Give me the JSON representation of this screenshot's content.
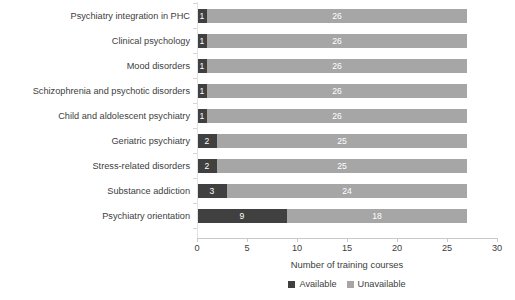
{
  "chart_data": {
    "type": "bar",
    "title": "",
    "subtitle": "",
    "orientation": "horizontal",
    "stacked": true,
    "xlabel": "Number of training courses",
    "ylabel": "",
    "xlim": [
      0,
      30
    ],
    "xticks": [
      0,
      5,
      10,
      15,
      20,
      25,
      30
    ],
    "xtick_labels": [
      "0",
      "5",
      "10",
      "15",
      "20",
      "25",
      "30"
    ],
    "grid": false,
    "legend_position": "bottom",
    "categories": [
      "Psychiatry integration in PHC",
      "Clinical psychology",
      "Mood disorders",
      "Schizophrenia and psychotic disorders",
      "Child and aldolescent psychiatry",
      "Geriatric psychiatry",
      "Stress-related disorders",
      "Substance addiction",
      "Psychiatry orientation"
    ],
    "series": [
      {
        "name": "Available",
        "color": "#404040",
        "values": [
          1,
          1,
          1,
          1,
          1,
          2,
          2,
          3,
          9
        ]
      },
      {
        "name": "Unavailable",
        "color": "#a6a6a6",
        "values": [
          26,
          26,
          26,
          26,
          26,
          25,
          25,
          24,
          18
        ]
      }
    ],
    "totals": [
      27,
      27,
      27,
      27,
      27,
      27,
      27,
      27,
      27
    ],
    "bar_labels": {
      "available": [
        "1",
        "1",
        "1",
        "1",
        "1",
        "2",
        "2",
        "3",
        "9"
      ],
      "unavailable": [
        "26",
        "26",
        "26",
        "26",
        "26",
        "25",
        "25",
        "24",
        "18"
      ]
    }
  },
  "legend": {
    "items": [
      {
        "label": "Available",
        "color": "#404040"
      },
      {
        "label": "Unavailable",
        "color": "#a6a6a6"
      }
    ]
  },
  "axis": {
    "xlabel": "Number of training courses"
  },
  "colors": {
    "available": "#404040",
    "unavailable": "#a6a6a6",
    "text": "#404040",
    "axis": "#c9c9c9",
    "background": "#ffffff"
  }
}
